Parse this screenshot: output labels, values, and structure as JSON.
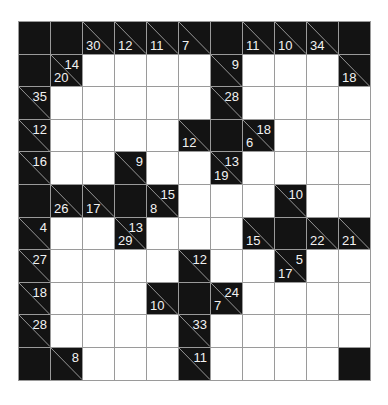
{
  "puzzle": {
    "type": "kakuro",
    "rows": 11,
    "cols": 11,
    "colors": {
      "black_cell": "#131313",
      "white_cell": "#ffffff",
      "grid_line": "#9a9a9a",
      "clue_text": "#f2f2f2"
    },
    "grid": [
      [
        {
          "t": "B"
        },
        {
          "t": "B"
        },
        {
          "t": "C",
          "d": "30"
        },
        {
          "t": "C",
          "d": "12"
        },
        {
          "t": "C",
          "d": "11"
        },
        {
          "t": "C",
          "d": "7"
        },
        {
          "t": "B"
        },
        {
          "t": "C",
          "d": "11"
        },
        {
          "t": "C",
          "d": "10"
        },
        {
          "t": "C",
          "d": "34"
        },
        {
          "t": "B"
        }
      ],
      [
        {
          "t": "B"
        },
        {
          "t": "C",
          "r": "14",
          "d": "20"
        },
        {
          "t": "W"
        },
        {
          "t": "W"
        },
        {
          "t": "W"
        },
        {
          "t": "W"
        },
        {
          "t": "C",
          "r": "9"
        },
        {
          "t": "W"
        },
        {
          "t": "W"
        },
        {
          "t": "W"
        },
        {
          "t": "C",
          "d": "18"
        }
      ],
      [
        {
          "t": "C",
          "r": "35"
        },
        {
          "t": "W"
        },
        {
          "t": "W"
        },
        {
          "t": "W"
        },
        {
          "t": "W"
        },
        {
          "t": "W"
        },
        {
          "t": "C",
          "r": "28"
        },
        {
          "t": "W"
        },
        {
          "t": "W"
        },
        {
          "t": "W"
        },
        {
          "t": "W"
        }
      ],
      [
        {
          "t": "C",
          "r": "12"
        },
        {
          "t": "W"
        },
        {
          "t": "W"
        },
        {
          "t": "W"
        },
        {
          "t": "W"
        },
        {
          "t": "C",
          "d": "12"
        },
        {
          "t": "B"
        },
        {
          "t": "C",
          "r": "18",
          "d": "6"
        },
        {
          "t": "W"
        },
        {
          "t": "W"
        },
        {
          "t": "W"
        }
      ],
      [
        {
          "t": "C",
          "r": "16"
        },
        {
          "t": "W"
        },
        {
          "t": "W"
        },
        {
          "t": "C",
          "r": "9"
        },
        {
          "t": "W"
        },
        {
          "t": "W"
        },
        {
          "t": "C",
          "r": "13",
          "d": "19"
        },
        {
          "t": "W"
        },
        {
          "t": "W"
        },
        {
          "t": "W"
        },
        {
          "t": "W"
        }
      ],
      [
        {
          "t": "B"
        },
        {
          "t": "C",
          "d": "26"
        },
        {
          "t": "C",
          "d": "17"
        },
        {
          "t": "B"
        },
        {
          "t": "C",
          "r": "15",
          "d": "8"
        },
        {
          "t": "W"
        },
        {
          "t": "W"
        },
        {
          "t": "W"
        },
        {
          "t": "C",
          "r": "10"
        },
        {
          "t": "W"
        },
        {
          "t": "W"
        }
      ],
      [
        {
          "t": "C",
          "r": "4"
        },
        {
          "t": "W"
        },
        {
          "t": "W"
        },
        {
          "t": "C",
          "r": "13",
          "d": "29"
        },
        {
          "t": "W"
        },
        {
          "t": "W"
        },
        {
          "t": "W"
        },
        {
          "t": "C",
          "d": "15"
        },
        {
          "t": "B"
        },
        {
          "t": "C",
          "d": "22"
        },
        {
          "t": "C",
          "d": "21"
        }
      ],
      [
        {
          "t": "C",
          "r": "27"
        },
        {
          "t": "W"
        },
        {
          "t": "W"
        },
        {
          "t": "W"
        },
        {
          "t": "W"
        },
        {
          "t": "C",
          "r": "12"
        },
        {
          "t": "W"
        },
        {
          "t": "W"
        },
        {
          "t": "C",
          "r": "5",
          "d": "17"
        },
        {
          "t": "W"
        },
        {
          "t": "W"
        }
      ],
      [
        {
          "t": "C",
          "r": "18"
        },
        {
          "t": "W"
        },
        {
          "t": "W"
        },
        {
          "t": "W"
        },
        {
          "t": "C",
          "d": "10"
        },
        {
          "t": "B"
        },
        {
          "t": "C",
          "r": "24",
          "d": "7"
        },
        {
          "t": "W"
        },
        {
          "t": "W"
        },
        {
          "t": "W"
        },
        {
          "t": "W"
        }
      ],
      [
        {
          "t": "C",
          "r": "28"
        },
        {
          "t": "W"
        },
        {
          "t": "W"
        },
        {
          "t": "W"
        },
        {
          "t": "W"
        },
        {
          "t": "C",
          "r": "33"
        },
        {
          "t": "W"
        },
        {
          "t": "W"
        },
        {
          "t": "W"
        },
        {
          "t": "W"
        },
        {
          "t": "W"
        }
      ],
      [
        {
          "t": "B"
        },
        {
          "t": "C",
          "r": "8"
        },
        {
          "t": "W"
        },
        {
          "t": "W"
        },
        {
          "t": "W"
        },
        {
          "t": "C",
          "r": "11"
        },
        {
          "t": "W"
        },
        {
          "t": "W"
        },
        {
          "t": "W"
        },
        {
          "t": "W"
        },
        {
          "t": "B"
        }
      ]
    ]
  }
}
